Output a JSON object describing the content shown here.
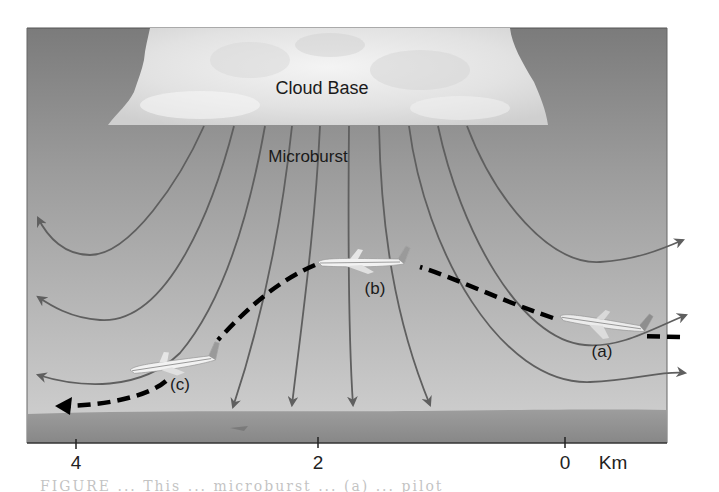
{
  "figure": {
    "type": "microburst-diagram",
    "labels": {
      "cloud_base": "Cloud Base",
      "microburst": "Microburst",
      "plane_a": "(a)",
      "plane_b": "(b)",
      "plane_c": "(c)"
    },
    "axis": {
      "unit": "Km",
      "ticks": [
        {
          "label": "4",
          "x": 76
        },
        {
          "label": "2",
          "x": 318
        },
        {
          "label": "0",
          "x": 565
        }
      ]
    },
    "colors": {
      "sky_top": "#7e7e7e",
      "sky_bottom": "#c9c9c9",
      "cloud": "#eeeeee",
      "streamline": "#5f5f5f",
      "ground": "#8f8f8f",
      "flight_path": "#000000",
      "plane_body": "#f2f2f2",
      "plane_tail": "#9a9a9a"
    },
    "caption_fragment": "FIGURE ... This ... microburst ... (a) ... pilot"
  }
}
